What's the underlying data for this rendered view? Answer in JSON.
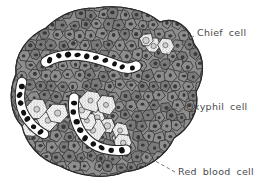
{
  "figure": {
    "kind": "histology-diagram",
    "background_color": "#ffffff"
  },
  "palette": {
    "chief_cell_fill": "#8d8d8d",
    "chief_cell_fill_dark": "#7a7a7a",
    "chief_cell_nucleus": "#3a3a3a",
    "cell_outline": "#2b2b2b",
    "oxyphil_fill": "#f2f2f2",
    "oxyphil_stipple": "#9a9a9a",
    "oxyphil_nucleus": "#cfcfcf",
    "capillary_lumen": "#ffffff",
    "red_blood_cell": "#111111",
    "label_text": "#4a4a4a",
    "leader_line": "#6b6b6b"
  },
  "labels": [
    {
      "id": "chief",
      "text": "Chief cell",
      "x": 197,
      "y": 27
    },
    {
      "id": "oxyphil",
      "text": "Oxyphil cell",
      "x": 186,
      "y": 101
    },
    {
      "id": "rbc",
      "text": "Red blood cell",
      "x": 178,
      "y": 166
    }
  ],
  "leaders": [
    {
      "id": "leader-chief",
      "from_x": 194,
      "from_y": 36,
      "to_x": 160,
      "to_y": 58
    },
    {
      "id": "leader-oxyphil",
      "from_x": 183,
      "from_y": 109,
      "to_x": 144,
      "to_y": 106
    },
    {
      "id": "leader-rbc",
      "from_x": 175,
      "from_y": 172,
      "to_x": 132,
      "to_y": 148
    }
  ],
  "structures": {
    "chief_cells": {
      "name": "chief cell",
      "count_approx": 170,
      "description": "small gray polygonal cells with dark round nuclei forming the bulk of the tissue mass"
    },
    "oxyphil_cells": {
      "name": "oxyphil cell",
      "clusters": 4,
      "description": "large pale stippled cells with faint nuclei in clustered groups"
    },
    "red_blood_cells": {
      "name": "red blood cell",
      "description": "dark oval cells packed inside white sinusoidal capillaries"
    },
    "capillaries": {
      "count": 3,
      "description": "white sinuous channels outlined in black running through the tissue"
    }
  }
}
